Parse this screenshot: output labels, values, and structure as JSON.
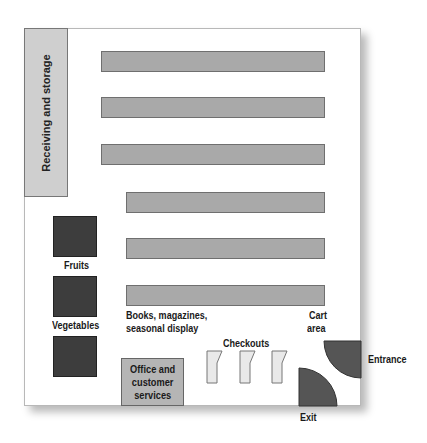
{
  "diagram": {
    "colors": {
      "storage": "#cfcfcf",
      "aisle": "#a9a9a9",
      "produce": "#3d3d3d",
      "office": "#b5b5b5",
      "checkout": "#e9e9e9",
      "door": "#555555"
    },
    "areas": {
      "receiving": "Receiving and storage",
      "fruits": "Fruits",
      "vegetables": "Vegetables",
      "books": "Books, magazines,",
      "books_line2": "seasonal display",
      "cart": "Cart",
      "cart_line2": "area",
      "checkouts": "Checkouts",
      "office_line1": "Office and",
      "office_line2": "customer",
      "office_line3": "services",
      "entrance": "Entrance",
      "exit": "Exit"
    },
    "aisles": [
      {
        "x": 101,
        "y": 51,
        "w": 224
      },
      {
        "x": 101,
        "y": 97,
        "w": 224
      },
      {
        "x": 101,
        "y": 144,
        "w": 224
      },
      {
        "x": 126,
        "y": 192,
        "w": 199
      },
      {
        "x": 126,
        "y": 238,
        "w": 199
      },
      {
        "x": 126,
        "y": 285,
        "w": 199
      }
    ],
    "checkout_count": 3
  }
}
